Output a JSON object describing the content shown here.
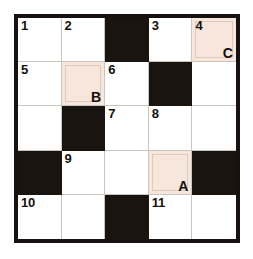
{
  "puzzle": {
    "type": "crossword-grid",
    "rows": 5,
    "columns": 5,
    "colors": {
      "page_background": "#ffffff",
      "cell_white": "#ffffff",
      "cell_black": "#1a1411",
      "cell_highlight": "#f7e6dc",
      "highlight_outline": "#e0c8ba",
      "grid_line": "#c9c6c2",
      "outer_border": "#17120f",
      "text": "#12100e"
    },
    "cells": [
      {
        "row": 1,
        "col": 1,
        "state": "white",
        "number": "1",
        "marker": ""
      },
      {
        "row": 1,
        "col": 2,
        "state": "white",
        "number": "2",
        "marker": ""
      },
      {
        "row": 1,
        "col": 3,
        "state": "black",
        "number": "",
        "marker": ""
      },
      {
        "row": 1,
        "col": 4,
        "state": "white",
        "number": "3",
        "marker": ""
      },
      {
        "row": 1,
        "col": 5,
        "state": "highlight",
        "number": "4",
        "marker": "C"
      },
      {
        "row": 2,
        "col": 1,
        "state": "white",
        "number": "5",
        "marker": ""
      },
      {
        "row": 2,
        "col": 2,
        "state": "highlight",
        "number": "",
        "marker": "B"
      },
      {
        "row": 2,
        "col": 3,
        "state": "white",
        "number": "6",
        "marker": ""
      },
      {
        "row": 2,
        "col": 4,
        "state": "black",
        "number": "",
        "marker": ""
      },
      {
        "row": 2,
        "col": 5,
        "state": "white",
        "number": "",
        "marker": ""
      },
      {
        "row": 3,
        "col": 1,
        "state": "white",
        "number": "",
        "marker": ""
      },
      {
        "row": 3,
        "col": 2,
        "state": "black",
        "number": "",
        "marker": ""
      },
      {
        "row": 3,
        "col": 3,
        "state": "white",
        "number": "7",
        "marker": ""
      },
      {
        "row": 3,
        "col": 4,
        "state": "white",
        "number": "8",
        "marker": ""
      },
      {
        "row": 3,
        "col": 5,
        "state": "white",
        "number": "",
        "marker": ""
      },
      {
        "row": 4,
        "col": 1,
        "state": "black",
        "number": "",
        "marker": ""
      },
      {
        "row": 4,
        "col": 2,
        "state": "white",
        "number": "9",
        "marker": ""
      },
      {
        "row": 4,
        "col": 3,
        "state": "white",
        "number": "",
        "marker": ""
      },
      {
        "row": 4,
        "col": 4,
        "state": "highlight",
        "number": "",
        "marker": "A"
      },
      {
        "row": 4,
        "col": 5,
        "state": "black",
        "number": "",
        "marker": ""
      },
      {
        "row": 5,
        "col": 1,
        "state": "white",
        "number": "10",
        "marker": ""
      },
      {
        "row": 5,
        "col": 2,
        "state": "white",
        "number": "",
        "marker": ""
      },
      {
        "row": 5,
        "col": 3,
        "state": "black",
        "number": "",
        "marker": ""
      },
      {
        "row": 5,
        "col": 4,
        "state": "white",
        "number": "11",
        "marker": ""
      },
      {
        "row": 5,
        "col": 5,
        "state": "white",
        "number": "",
        "marker": ""
      }
    ]
  }
}
